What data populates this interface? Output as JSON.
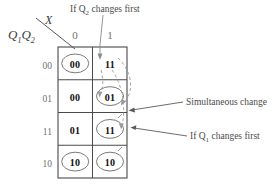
{
  "diagram": {
    "title_axis_row": "Q1Q2",
    "title_axis_row_base": "Q",
    "title_axis_col": "X",
    "column_headers": [
      "0",
      "1"
    ],
    "row_headers": [
      "00",
      "01",
      "11",
      "10"
    ],
    "rows": [
      {
        "label": "00",
        "cells": [
          {
            "value": "00",
            "circled": true
          },
          {
            "value": "11",
            "circled": false
          }
        ]
      },
      {
        "label": "01",
        "cells": [
          {
            "value": "00",
            "circled": false
          },
          {
            "value": "01",
            "circled": true
          }
        ]
      },
      {
        "label": "11",
        "cells": [
          {
            "value": "01",
            "circled": false
          },
          {
            "value": "11",
            "circled": true
          }
        ]
      },
      {
        "label": "10",
        "cells": [
          {
            "value": "10",
            "circled": true
          },
          {
            "value": "10",
            "circled": true
          }
        ]
      }
    ],
    "annotations": {
      "top": "If Q2 changes first",
      "top_prefix": "If Q",
      "top_sub": "2",
      "top_suffix": " changes first",
      "simultaneous": "Simultaneous change",
      "bottom_prefix": "If Q",
      "bottom_sub": "1",
      "bottom_suffix": " changes first"
    },
    "colors": {
      "grid": "#4a4a4a",
      "text": "#111111",
      "muted": "#6f6f6f",
      "dashed": "#8a8a8a",
      "background": "#ffffff"
    }
  }
}
